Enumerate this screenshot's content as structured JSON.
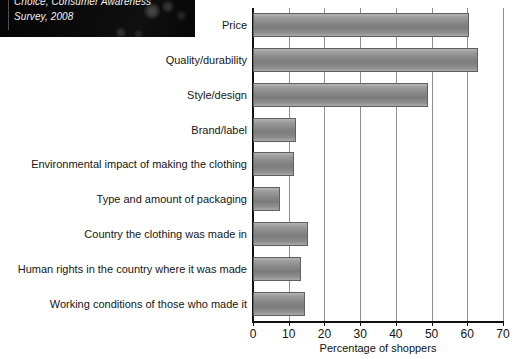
{
  "photo_caption": {
    "line1": "Choice, Consumer Awareness",
    "line2": "Survey, 2008"
  },
  "chart_data": {
    "type": "bar",
    "orientation": "horizontal",
    "title": "",
    "xlabel": "Percentage of shoppers",
    "ylabel": "",
    "xlim": [
      0,
      70
    ],
    "xticks": [
      0,
      10,
      20,
      30,
      40,
      50,
      60,
      70
    ],
    "grid": true,
    "legend": "none",
    "bar_color": "#8a8a8a",
    "axis_color": "#111111",
    "gridline_color": "#8e8e8e",
    "categories": [
      "Price",
      "Quality/durability",
      "Style/design",
      "Brand/label",
      "Environmental impact of making the clothing",
      "Type and amount of packaging",
      "Country the clothing was made in",
      "Human rights in the country where it was made",
      "Working conditions of those who made it"
    ],
    "values": [
      60.5,
      63,
      49,
      12,
      11.5,
      7.5,
      15.5,
      13.5,
      14.5
    ]
  }
}
